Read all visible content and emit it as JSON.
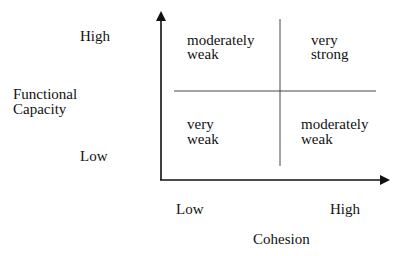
{
  "y_axis": {
    "label_line1": "Functional",
    "label_line2": "Capacity",
    "high": "High",
    "low": "Low"
  },
  "x_axis": {
    "label": "Cohesion",
    "low": "Low",
    "high": "High"
  },
  "quadrants": {
    "top_left": {
      "line1": "moderately",
      "line2": "weak"
    },
    "top_right": {
      "line1": "very",
      "line2": "strong"
    },
    "bottom_left": {
      "line1": "very",
      "line2": "weak"
    },
    "bottom_right": {
      "line1": "moderately",
      "line2": "weak"
    }
  }
}
